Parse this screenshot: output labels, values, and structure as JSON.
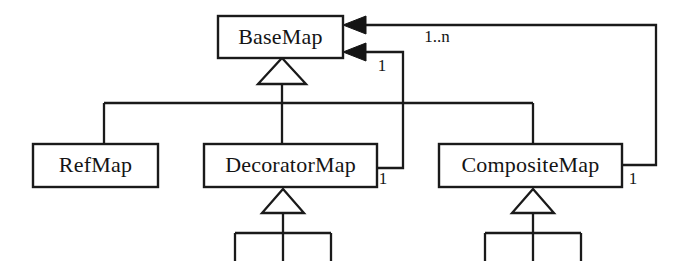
{
  "diagram": {
    "type": "uml-class-diagram",
    "canvas": {
      "width": 687,
      "height": 273,
      "background": "#ffffff"
    },
    "line_color": "#1a1a1a",
    "text_color": "#141414",
    "classes": [
      {
        "id": "basemap",
        "name": "BaseMap",
        "x": 218,
        "y": 16,
        "w": 125,
        "h": 42
      },
      {
        "id": "refmap",
        "name": "RefMap",
        "x": 33,
        "y": 144,
        "w": 125,
        "h": 43
      },
      {
        "id": "decoratormap",
        "name": "DecoratorMap",
        "x": 204,
        "y": 144,
        "w": 173,
        "h": 43
      },
      {
        "id": "compositemap",
        "name": "CompositeMap",
        "x": 439,
        "y": 144,
        "w": 183,
        "h": 43
      }
    ],
    "generalizations": [
      {
        "id": "gen-basemap",
        "parent": "basemap",
        "children": [
          "refmap",
          "decoratormap",
          "compositemap"
        ]
      },
      {
        "id": "gen-decoratormap",
        "parent": "decoratormap",
        "children": [
          "sub-a",
          "sub-b",
          "sub-c"
        ]
      },
      {
        "id": "gen-compositemap",
        "parent": "compositemap",
        "children": [
          "sub-d",
          "sub-e",
          "sub-f"
        ]
      }
    ],
    "associations": [
      {
        "id": "assoc-decoratormap-basemap",
        "from": "decoratormap",
        "to": "basemap",
        "source_multiplicity": "1",
        "target_multiplicity": "1",
        "arrow": "filled"
      },
      {
        "id": "assoc-compositemap-basemap",
        "from": "compositemap",
        "to": "basemap",
        "source_multiplicity": "1",
        "target_multiplicity": "1..n",
        "arrow": "filled"
      }
    ],
    "labels": {
      "mult_one_a": "1",
      "mult_one_n": "1..n",
      "mult_one_b": "1",
      "mult_one_c": "1"
    }
  }
}
